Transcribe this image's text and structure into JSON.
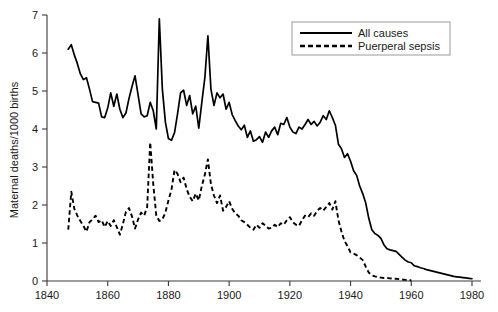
{
  "chart_data": {
    "type": "line",
    "title": "",
    "xlabel": "",
    "ylabel": "Maternal deaths/1000 births",
    "xlim": [
      1840,
      1980
    ],
    "ylim": [
      0,
      7
    ],
    "xticks": [
      1840,
      1860,
      1880,
      1900,
      1920,
      1940,
      1960,
      1980
    ],
    "yticks": [
      0,
      1,
      2,
      3,
      4,
      5,
      6,
      7
    ],
    "xtick_labels": [
      "1840",
      "1860",
      "1880",
      "1900",
      "1920",
      "1940",
      "1960",
      "1980"
    ],
    "ytick_labels": [
      "0",
      "1",
      "2",
      "3",
      "4",
      "5",
      "6",
      "7"
    ],
    "grid": false,
    "legend_position": "top-right",
    "legend_entries": [
      "All causes",
      "Puerperal sepsis"
    ],
    "series": [
      {
        "name": "All causes",
        "style": "solid",
        "color": "#000000",
        "x": [
          1847,
          1848,
          1849,
          1850,
          1851,
          1852,
          1853,
          1854,
          1855,
          1856,
          1857,
          1858,
          1859,
          1860,
          1861,
          1862,
          1863,
          1864,
          1865,
          1866,
          1867,
          1868,
          1869,
          1870,
          1871,
          1872,
          1873,
          1874,
          1875,
          1876,
          1877,
          1878,
          1879,
          1880,
          1881,
          1882,
          1883,
          1884,
          1885,
          1886,
          1887,
          1888,
          1889,
          1890,
          1891,
          1892,
          1893,
          1894,
          1895,
          1896,
          1897,
          1898,
          1899,
          1900,
          1901,
          1902,
          1903,
          1904,
          1905,
          1906,
          1907,
          1908,
          1909,
          1910,
          1911,
          1912,
          1913,
          1914,
          1915,
          1916,
          1917,
          1918,
          1919,
          1920,
          1921,
          1922,
          1923,
          1924,
          1925,
          1926,
          1927,
          1928,
          1929,
          1930,
          1931,
          1932,
          1933,
          1934,
          1935,
          1936,
          1937,
          1938,
          1939,
          1940,
          1941,
          1942,
          1943,
          1944,
          1945,
          1946,
          1947,
          1948,
          1949,
          1950,
          1951,
          1952,
          1953,
          1954,
          1955,
          1956,
          1957,
          1958,
          1959,
          1960,
          1961,
          1962,
          1963,
          1964,
          1965,
          1966,
          1967,
          1968,
          1969,
          1970,
          1971,
          1972,
          1973,
          1974,
          1975,
          1976,
          1977,
          1978,
          1979,
          1980
        ],
        "y": [
          6.1,
          6.22,
          5.95,
          5.72,
          5.45,
          5.3,
          5.35,
          5.05,
          4.72,
          4.7,
          4.68,
          4.32,
          4.3,
          4.55,
          4.95,
          4.6,
          4.92,
          4.52,
          4.3,
          4.42,
          4.8,
          5.12,
          5.4,
          4.9,
          4.4,
          4.32,
          4.35,
          4.7,
          4.48,
          4.0,
          6.9,
          5.05,
          4.18,
          3.75,
          3.7,
          3.9,
          4.4,
          4.95,
          5.02,
          4.62,
          4.88,
          4.4,
          4.6,
          4.02,
          4.7,
          5.35,
          6.45,
          5.05,
          4.62,
          4.95,
          4.82,
          4.92,
          4.52,
          4.7,
          4.38,
          4.22,
          4.08,
          3.98,
          4.1,
          3.78,
          3.95,
          3.68,
          3.72,
          3.8,
          3.65,
          3.92,
          3.78,
          3.95,
          4.05,
          3.85,
          4.15,
          4.12,
          4.3,
          4.05,
          3.92,
          3.88,
          4.05,
          4.0,
          4.12,
          4.25,
          4.12,
          4.2,
          4.08,
          4.18,
          4.35,
          4.25,
          4.48,
          4.3,
          4.1,
          3.6,
          3.48,
          3.25,
          3.35,
          3.15,
          2.9,
          2.78,
          2.5,
          2.3,
          2.05,
          1.65,
          1.35,
          1.25,
          1.2,
          1.12,
          0.95,
          0.85,
          0.82,
          0.8,
          0.78,
          0.7,
          0.62,
          0.55,
          0.5,
          0.48,
          0.4,
          0.38,
          0.35,
          0.33,
          0.3,
          0.28,
          0.26,
          0.24,
          0.22,
          0.2,
          0.18,
          0.16,
          0.14,
          0.12,
          0.11,
          0.1,
          0.09,
          0.08,
          0.07,
          0.06
        ]
      },
      {
        "name": "Puerperal sepsis",
        "style": "dashed",
        "color": "#000000",
        "x": [
          1847,
          1848,
          1849,
          1850,
          1851,
          1852,
          1853,
          1854,
          1855,
          1856,
          1857,
          1858,
          1859,
          1860,
          1861,
          1862,
          1863,
          1864,
          1865,
          1866,
          1867,
          1868,
          1869,
          1870,
          1871,
          1872,
          1873,
          1874,
          1875,
          1876,
          1877,
          1878,
          1879,
          1880,
          1881,
          1882,
          1883,
          1884,
          1885,
          1886,
          1887,
          1888,
          1889,
          1890,
          1891,
          1892,
          1893,
          1894,
          1895,
          1896,
          1897,
          1898,
          1899,
          1900,
          1901,
          1902,
          1903,
          1904,
          1905,
          1906,
          1907,
          1908,
          1909,
          1910,
          1911,
          1912,
          1913,
          1914,
          1915,
          1916,
          1917,
          1918,
          1919,
          1920,
          1921,
          1922,
          1923,
          1924,
          1925,
          1926,
          1927,
          1928,
          1929,
          1930,
          1931,
          1932,
          1933,
          1934,
          1935,
          1936,
          1937,
          1938,
          1939,
          1940,
          1941,
          1942,
          1943,
          1944,
          1945,
          1946,
          1947,
          1948,
          1949,
          1950,
          1951,
          1952,
          1953,
          1954,
          1955,
          1956,
          1957,
          1958,
          1959,
          1960
        ],
        "y": [
          1.35,
          2.35,
          1.9,
          1.72,
          1.58,
          1.45,
          1.3,
          1.55,
          1.62,
          1.72,
          1.55,
          1.6,
          1.42,
          1.58,
          1.45,
          1.6,
          1.42,
          1.22,
          1.5,
          1.82,
          1.92,
          1.7,
          1.38,
          1.62,
          1.8,
          1.72,
          1.95,
          3.65,
          2.55,
          1.72,
          1.58,
          1.62,
          1.8,
          2.12,
          2.4,
          2.92,
          2.82,
          2.6,
          2.72,
          2.42,
          2.22,
          2.1,
          2.3,
          2.12,
          2.5,
          2.8,
          3.2,
          2.55,
          2.25,
          2.05,
          2.25,
          1.85,
          1.95,
          2.1,
          1.9,
          1.78,
          1.72,
          1.6,
          1.55,
          1.48,
          1.4,
          1.35,
          1.48,
          1.4,
          1.52,
          1.45,
          1.38,
          1.4,
          1.48,
          1.42,
          1.52,
          1.48,
          1.6,
          1.68,
          1.55,
          1.48,
          1.45,
          1.6,
          1.72,
          1.68,
          1.78,
          1.72,
          1.85,
          1.92,
          1.85,
          1.95,
          2.05,
          1.88,
          2.1,
          1.6,
          1.3,
          1.05,
          0.92,
          0.75,
          0.72,
          0.68,
          0.62,
          0.55,
          0.38,
          0.22,
          0.15,
          0.12,
          0.1,
          0.09,
          0.08,
          0.08,
          0.07,
          0.06,
          0.06,
          0.05,
          0.04,
          0.03,
          0.02,
          0.02
        ]
      }
    ]
  },
  "axes": {
    "y_title": "Maternal deaths/1000 births"
  },
  "legend": {
    "items": [
      {
        "label": "All causes",
        "style": "solid"
      },
      {
        "label": "Puerperal sepsis",
        "style": "dashed"
      }
    ]
  }
}
